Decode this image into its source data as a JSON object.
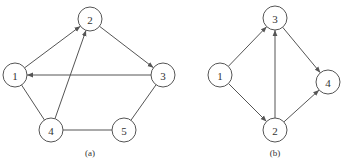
{
  "graphs": [
    {
      "id": "a",
      "caption": "(a)",
      "caption_pos": [
        90,
        156
      ],
      "nodes": [
        {
          "label": "1",
          "x": 15,
          "y": 75
        },
        {
          "label": "2",
          "x": 90,
          "y": 19
        },
        {
          "label": "3",
          "x": 163,
          "y": 75
        },
        {
          "label": "4",
          "x": 51,
          "y": 130
        },
        {
          "label": "5",
          "x": 124,
          "y": 130
        }
      ],
      "edges": [
        {
          "from": "1",
          "to": "2",
          "directed": true
        },
        {
          "from": "4",
          "to": "2",
          "directed": true
        },
        {
          "from": "2",
          "to": "3",
          "directed": true
        },
        {
          "from": "3",
          "to": "1",
          "directed": true
        },
        {
          "from": "1",
          "to": "4",
          "directed": false
        },
        {
          "from": "4",
          "to": "5",
          "directed": false
        },
        {
          "from": "5",
          "to": "3",
          "directed": false
        }
      ]
    },
    {
      "id": "b",
      "caption": "(b)",
      "caption_pos": [
        275,
        156
      ],
      "nodes": [
        {
          "label": "1",
          "x": 220,
          "y": 75
        },
        {
          "label": "2",
          "x": 275,
          "y": 130
        },
        {
          "label": "3",
          "x": 275,
          "y": 18
        },
        {
          "label": "4",
          "x": 328,
          "y": 82
        }
      ],
      "edges": [
        {
          "from": "1",
          "to": "3",
          "directed": true
        },
        {
          "from": "1",
          "to": "2",
          "directed": true
        },
        {
          "from": "2",
          "to": "3",
          "directed": true
        },
        {
          "from": "3",
          "to": "4",
          "directed": true
        },
        {
          "from": "2",
          "to": "4",
          "directed": true
        }
      ]
    }
  ],
  "node_radius": 12,
  "colors": {
    "stroke": "#555555",
    "text": "#333333"
  }
}
